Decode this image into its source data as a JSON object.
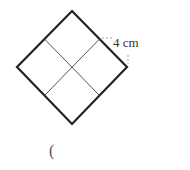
{
  "diagram": {
    "shape": "square rotated 45 degrees, divided into 4 smaller squares",
    "dimension_label": "4 cm",
    "answer_bracket": "(",
    "colors": {
      "outline": "#222222",
      "inner": "#555555",
      "dash": "#888888"
    }
  }
}
